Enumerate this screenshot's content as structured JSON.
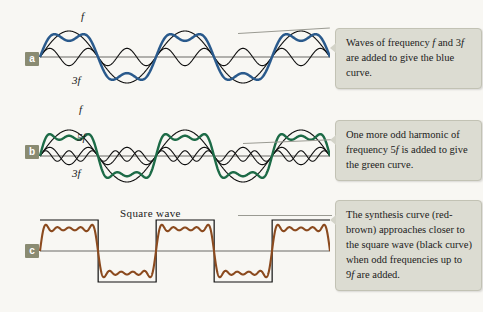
{
  "figure": {
    "background_color": "#f8f7f3",
    "colors": {
      "blue_curve": "#2a5a8c",
      "green_curve": "#1d6b47",
      "red_brown_curve": "#8b4a1e",
      "component_curve": "#111111",
      "axis": "#6b6b66",
      "callout_background": "#dcdcd2",
      "tag_background": "#8a8b72"
    }
  },
  "panels": [
    {
      "tag": "a",
      "curve_labels": [
        {
          "name": "fundamental",
          "text": "f"
        },
        {
          "name": "third-harmonic",
          "text": "3f"
        }
      ],
      "callout": {
        "line1": "Waves of frequency ",
        "italic1": "f",
        "line1b": " and",
        "line2a": "3",
        "italic2": "f",
        "line2b": " are added to give the",
        "line3": "blue curve."
      }
    },
    {
      "tag": "b",
      "curve_labels": [
        {
          "name": "fundamental",
          "text": "f"
        },
        {
          "name": "fifth-harmonic",
          "text": "5f"
        },
        {
          "name": "third-harmonic",
          "text": "3f"
        }
      ],
      "callout": {
        "line1": "One more odd harmonic",
        "line2a": "of frequency 5",
        "italic2": "f",
        "line2b": " is added",
        "line3": "to give the green curve."
      }
    },
    {
      "tag": "c",
      "square_wave_label": "Square wave",
      "callout": {
        "line1": "The synthesis curve",
        "line2": "(red-brown) approaches",
        "line3": "closer to the square wave",
        "line4": "(black curve) when odd",
        "line5a": "frequencies up to 9",
        "italic5": "f",
        "line5b": " are",
        "line6": "added."
      }
    }
  ],
  "chart_data": {
    "type": "line",
    "xlabel": "",
    "ylabel": "",
    "grid": false,
    "legend": "inline curve labels",
    "panels": [
      {
        "id": "a",
        "description": "Fundamental f and third harmonic 3f summed to give the blue synthesis curve",
        "series": [
          {
            "name": "f",
            "harmonic": 1,
            "amplitude": 1.0,
            "color": "#111111",
            "label": "f"
          },
          {
            "name": "3f",
            "harmonic": 3,
            "amplitude": 0.3333,
            "color": "#111111",
            "label": "3f"
          },
          {
            "name": "sum",
            "harmonics": [
              1,
              3
            ],
            "color": "#2a5a8c",
            "label": "blue curve"
          }
        ],
        "cycles": 2.5
      },
      {
        "id": "b",
        "description": "Fundamental f plus third harmonic 3f plus fifth harmonic 5f summed to give the green synthesis curve",
        "series": [
          {
            "name": "f",
            "harmonic": 1,
            "amplitude": 1.0,
            "color": "#111111",
            "label": "f"
          },
          {
            "name": "3f",
            "harmonic": 3,
            "amplitude": 0.3333,
            "color": "#111111",
            "label": "3f"
          },
          {
            "name": "5f",
            "harmonic": 5,
            "amplitude": 0.2,
            "color": "#111111",
            "label": "5f"
          },
          {
            "name": "sum",
            "harmonics": [
              1,
              3,
              5
            ],
            "color": "#1d6b47",
            "label": "green curve"
          }
        ],
        "cycles": 2.5
      },
      {
        "id": "c",
        "description": "Square wave (black) compared with the red-brown synthesis curve of odd harmonics up to 9f, showing Gibbs ripple",
        "series": [
          {
            "name": "square wave",
            "color": "#111111",
            "label": "Square wave"
          },
          {
            "name": "sum",
            "harmonics": [
              1,
              3,
              5,
              7,
              9
            ],
            "color": "#8b4a1e",
            "label": "red-brown synthesis curve"
          }
        ],
        "cycles": 2.5
      }
    ]
  }
}
